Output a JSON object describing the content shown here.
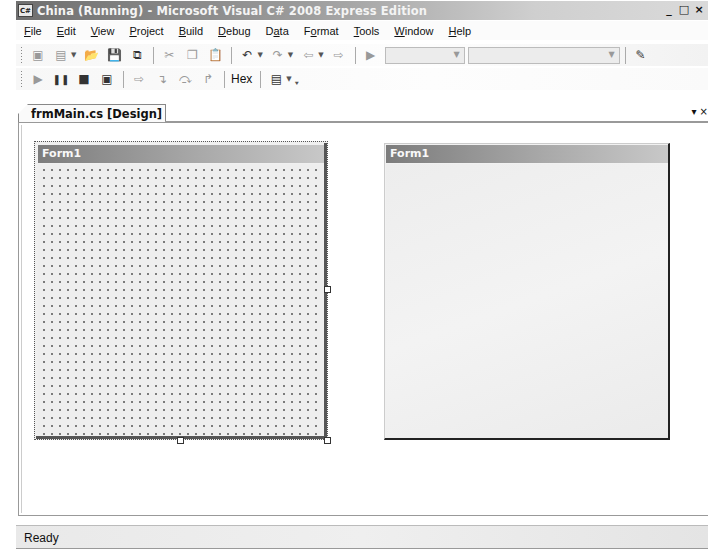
{
  "window": {
    "title": "China (Running) - Microsoft Visual C# 2008 Express Edition",
    "app_icon": "C#",
    "controls": {
      "minimize": "_",
      "maximize": "□",
      "close": "×"
    }
  },
  "menu": {
    "items": [
      {
        "label": "File",
        "mnemonic": "F"
      },
      {
        "label": "Edit",
        "mnemonic": "E"
      },
      {
        "label": "View",
        "mnemonic": "V"
      },
      {
        "label": "Project",
        "mnemonic": "P"
      },
      {
        "label": "Build",
        "mnemonic": "B"
      },
      {
        "label": "Debug",
        "mnemonic": "D"
      },
      {
        "label": "Data",
        "mnemonic": "a"
      },
      {
        "label": "Format",
        "mnemonic": "o"
      },
      {
        "label": "Tools",
        "mnemonic": "T"
      },
      {
        "label": "Window",
        "mnemonic": "W"
      },
      {
        "label": "Help",
        "mnemonic": "H"
      }
    ]
  },
  "toolbar_standard": {
    "icons": [
      "new-project-icon",
      "add-item-icon",
      "open-file-icon",
      "save-icon",
      "save-all-icon",
      "cut-icon",
      "copy-icon",
      "paste-icon",
      "undo-icon",
      "redo-icon",
      "navigate-backward-icon",
      "navigate-forward-icon",
      "start-debugging-icon",
      "solution-configurations-combo",
      "solution-platforms-combo",
      "new-window-icon"
    ],
    "config_combo_value": "",
    "platform_combo_value": ""
  },
  "toolbar_debug": {
    "icons": [
      "continue-icon",
      "break-all-icon",
      "stop-debugging-icon",
      "restart-icon",
      "show-next-statement-icon",
      "step-into-icon",
      "step-over-icon",
      "step-out-icon"
    ],
    "hex_label": "Hex",
    "window_button_icon": "breakpoints-window-icon"
  },
  "tabs": {
    "active": {
      "label": "frmMain.cs [Design]",
      "lock_glyph": "🔒"
    },
    "overflow_glyph": "▾ ×"
  },
  "designer": {
    "form_title": "Form1"
  },
  "running_app": {
    "form_title": "Form1"
  },
  "status": {
    "text": "Ready"
  }
}
